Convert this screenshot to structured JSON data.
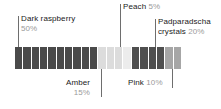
{
  "chart_data": {
    "type": "bar",
    "subtype": "stacked-segmented-proportion-bar",
    "title": "",
    "xlabel": "",
    "ylabel": "",
    "total_segments": 20,
    "segment_value_percent": 5,
    "categories": [
      "Dark raspberry",
      "Amber",
      "Peach",
      "Padparadscha crystals",
      "Pink"
    ],
    "values": [
      50,
      15,
      5,
      20,
      10
    ],
    "value_labels": [
      "50%",
      "15%",
      "5%",
      "20%",
      "10%"
    ],
    "segment_counts": [
      10,
      3,
      1,
      4,
      2
    ],
    "colors": [
      "#4a4a4a",
      "#dcdcdc",
      "#ececec",
      "#4f4f4f",
      "#a6a6a6"
    ],
    "grid": false,
    "legend": "callout-labels",
    "ylim": [
      0,
      100
    ]
  },
  "bar": {
    "segments": [
      {
        "index": 1,
        "category": "Dark raspberry",
        "color": "#4a4a4a"
      },
      {
        "index": 2,
        "category": "Dark raspberry",
        "color": "#4a4a4a"
      },
      {
        "index": 3,
        "category": "Dark raspberry",
        "color": "#4a4a4a"
      },
      {
        "index": 4,
        "category": "Dark raspberry",
        "color": "#4a4a4a"
      },
      {
        "index": 5,
        "category": "Dark raspberry",
        "color": "#4a4a4a"
      },
      {
        "index": 6,
        "category": "Dark raspberry",
        "color": "#4a4a4a"
      },
      {
        "index": 7,
        "category": "Dark raspberry",
        "color": "#4a4a4a"
      },
      {
        "index": 8,
        "category": "Dark raspberry",
        "color": "#4a4a4a"
      },
      {
        "index": 9,
        "category": "Dark raspberry",
        "color": "#4a4a4a"
      },
      {
        "index": 10,
        "category": "Dark raspberry",
        "color": "#4a4a4a"
      },
      {
        "index": 11,
        "category": "Amber",
        "color": "#dcdcdc"
      },
      {
        "index": 12,
        "category": "Amber",
        "color": "#dcdcdc"
      },
      {
        "index": 13,
        "category": "Amber",
        "color": "#dcdcdc"
      },
      {
        "index": 14,
        "category": "Peach",
        "color": "#ececec"
      },
      {
        "index": 15,
        "category": "Padparadscha crystals",
        "color": "#4f4f4f"
      },
      {
        "index": 16,
        "category": "Padparadscha crystals",
        "color": "#4f4f4f"
      },
      {
        "index": 17,
        "category": "Padparadscha crystals",
        "color": "#4f4f4f"
      },
      {
        "index": 18,
        "category": "Padparadscha crystals",
        "color": "#4f4f4f"
      },
      {
        "index": 19,
        "category": "Pink",
        "color": "#a6a6a6"
      },
      {
        "index": 20,
        "category": "Pink",
        "color": "#a6a6a6"
      }
    ]
  },
  "callouts": {
    "dark_raspberry": {
      "name": "Dark raspberry",
      "percent": "50%"
    },
    "amber": {
      "name": "Amber",
      "percent": "15%"
    },
    "peach": {
      "name": "Peach",
      "percent": "5%"
    },
    "padparadscha": {
      "name_line1": "Padparadscha",
      "name_line2": "crystals",
      "percent": "20%"
    },
    "pink": {
      "name": "Pink",
      "percent": "10%"
    }
  }
}
